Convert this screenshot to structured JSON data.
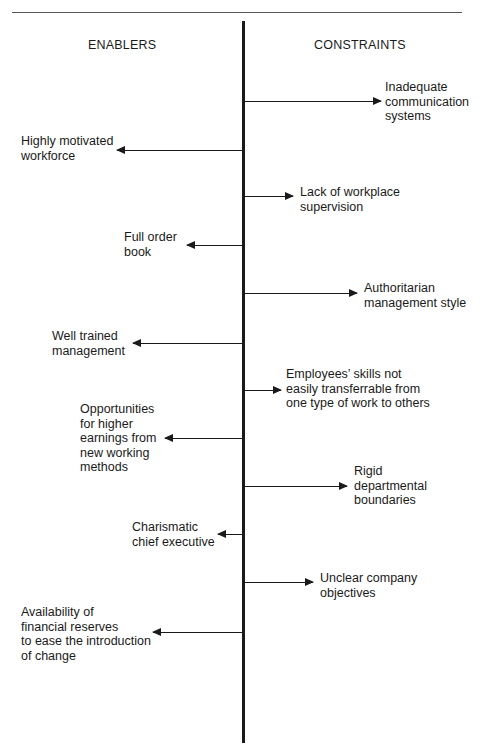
{
  "diagram": {
    "type": "force-field-analysis",
    "columns": {
      "left_heading": "ENABLERS",
      "right_heading": "CONSTRAINTS"
    },
    "forces": [
      {
        "side": "constraint",
        "label": "Inadequate\ncommunication\nsystems"
      },
      {
        "side": "enabler",
        "label": "Highly motivated\nworkforce"
      },
      {
        "side": "constraint",
        "label": "Lack of workplace\nsupervision"
      },
      {
        "side": "enabler",
        "label": "Full order\nbook"
      },
      {
        "side": "constraint",
        "label": "Authoritarian\nmanagement style"
      },
      {
        "side": "enabler",
        "label": "Well trained\nmanagement"
      },
      {
        "side": "constraint",
        "label": "Employees’ skills not\neasily transferrable from\none type of work to others"
      },
      {
        "side": "enabler",
        "label": "Opportunities\nfor higher\nearnings from\nnew working\nmethods"
      },
      {
        "side": "constraint",
        "label": "Rigid\ndepartmental\nboundaries"
      },
      {
        "side": "enabler",
        "label": "Charismatic\nchief executive"
      },
      {
        "side": "constraint",
        "label": "Unclear company\nobjectives"
      },
      {
        "side": "enabler",
        "label": "Availability of\nfinancial reserves\nto ease the introduction\nof change"
      }
    ]
  }
}
